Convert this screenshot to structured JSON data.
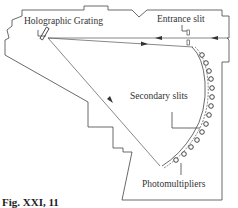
{
  "figure": {
    "caption": "Fig. XXI, 11"
  },
  "labels": {
    "grating": "Holographic Grating",
    "entrance_slit": "Entrance slit",
    "secondary_slits": "Secondary slits",
    "photomultipliers": "Photomultipliers"
  },
  "components": {
    "photomultiplier_count": 14,
    "colors": {
      "line": "#444444",
      "text": "#333333",
      "background": "#ffffff"
    }
  }
}
